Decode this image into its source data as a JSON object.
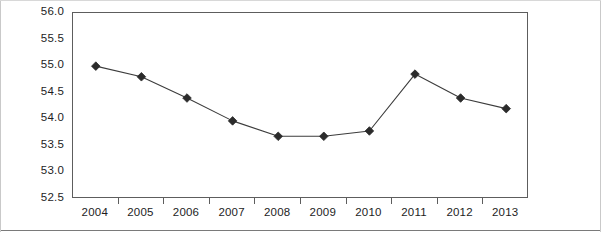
{
  "chart_data": {
    "type": "line",
    "title": "",
    "subtitle": "",
    "xlabel": "",
    "ylabel": "",
    "categories": [
      "2004",
      "2005",
      "2006",
      "2007",
      "2008",
      "2009",
      "2010",
      "2011",
      "2012",
      "2013"
    ],
    "values": [
      55.0,
      54.8,
      54.4,
      53.97,
      53.68,
      53.68,
      53.78,
      54.85,
      54.4,
      54.2
    ],
    "series": [
      {
        "name": "",
        "values": [
          55.0,
          54.8,
          54.4,
          53.97,
          53.68,
          53.68,
          53.78,
          54.85,
          54.4,
          54.2
        ]
      }
    ],
    "ylim": [
      52.5,
      56.0
    ],
    "ytick_labels": [
      "56.0",
      "55.5",
      "55.0",
      "54.5",
      "54.0",
      "53.5",
      "53.0",
      "52.5"
    ],
    "ytick_values": [
      56.0,
      55.5,
      55.0,
      54.5,
      54.0,
      53.5,
      53.0,
      52.5
    ],
    "xtick_labels": [
      "2004",
      "2005",
      "2006",
      "2007",
      "2008",
      "2009",
      "2010",
      "2011",
      "2012",
      "2013"
    ],
    "grid": true,
    "grid_axis": "y",
    "legend": false,
    "legend_position": "none",
    "marker": "diamond",
    "line_color": "#3c3c3c",
    "marker_color": "#2b2b2b",
    "grid_color": "#8d8d8d",
    "axis_color": "#5d5d5d",
    "background_color": "#ffffff",
    "annotations": []
  }
}
